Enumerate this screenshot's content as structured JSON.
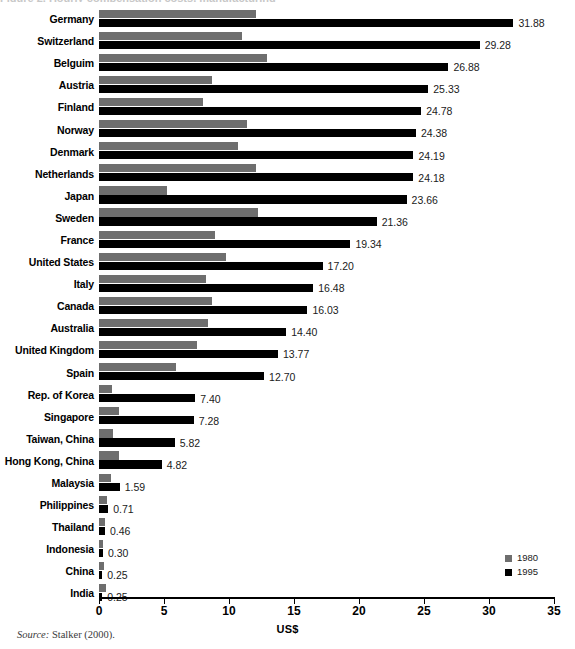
{
  "figure": {
    "axis_title": "US$",
    "source_prefix": "Source:",
    "source_text": "Stalker (2000).",
    "clipped_title": "Figure 2. Hourly compensation costs, manufacturing",
    "colors": {
      "series_1980": "#6e6e6e",
      "series_1995": "#000000",
      "axis": "#000000",
      "background": "#ffffff"
    }
  },
  "legend": {
    "position": "bottom-right",
    "entries": [
      {
        "label": "1980",
        "color": "#6e6e6e"
      },
      {
        "label": "1995",
        "color": "#000000"
      }
    ]
  },
  "chart_data": {
    "type": "bar",
    "orientation": "horizontal",
    "title": "",
    "xlabel": "US$",
    "ylabel": "",
    "xlim": [
      0,
      35
    ],
    "xticks": [
      0,
      5,
      10,
      15,
      20,
      25,
      30,
      35
    ],
    "xtick_labels": [
      "0",
      "5",
      "10",
      "15",
      "20",
      "25",
      "30",
      "35"
    ],
    "grid": false,
    "legend_position": "bottom-right",
    "categories": [
      "Germany",
      "Switzerland",
      "Belguim",
      "Austria",
      "Finland",
      "Norway",
      "Denmark",
      "Netherlands",
      "Japan",
      "Sweden",
      "France",
      "United States",
      "Italy",
      "Canada",
      "Australia",
      "United Kingdom",
      "Spain",
      "Rep. of Korea",
      "Singapore",
      "Taiwan, China",
      "Hong Kong, China",
      "Malaysia",
      "Philippines",
      "Thailand",
      "Indonesia",
      "China",
      "India"
    ],
    "series": [
      {
        "name": "1980",
        "color": "#6e6e6e",
        "values": [
          12.1,
          11.0,
          12.9,
          8.7,
          8.0,
          11.4,
          10.7,
          12.1,
          5.2,
          12.2,
          8.9,
          9.8,
          8.2,
          8.7,
          8.4,
          7.5,
          5.9,
          1.0,
          1.5,
          1.1,
          1.55,
          0.95,
          0.65,
          0.45,
          0.3,
          0.35,
          0.5
        ]
      },
      {
        "name": "1995",
        "color": "#000000",
        "values": [
          31.88,
          29.28,
          26.88,
          25.33,
          24.78,
          24.38,
          24.19,
          24.18,
          23.66,
          21.36,
          19.34,
          17.2,
          16.48,
          16.03,
          14.4,
          13.77,
          12.7,
          7.4,
          7.28,
          5.82,
          4.82,
          1.59,
          0.71,
          0.46,
          0.3,
          0.25,
          0.25
        ],
        "labels": [
          "31.88",
          "29.28",
          "26.88",
          "25.33",
          "24.78",
          "24.38",
          "24.19",
          "24.18",
          "23.66",
          "21.36",
          "19.34",
          "17.20",
          "16.48",
          "16.03",
          "14.40",
          "13.77",
          "12.70",
          "7.40",
          "7.28",
          "5.82",
          "4.82",
          "1.59",
          "0.71",
          "0.46",
          "0.30",
          "0.25",
          "0.25"
        ]
      }
    ]
  }
}
